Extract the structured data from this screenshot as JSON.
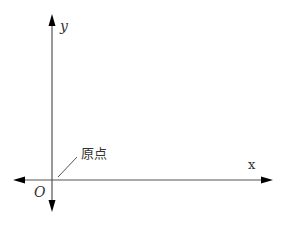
{
  "diagram": {
    "type": "coordinate-axes",
    "x_axis": {
      "label": "x",
      "direction": "bidirectional"
    },
    "y_axis": {
      "label": "y",
      "direction": "bidirectional"
    },
    "origin": {
      "label": "O",
      "annotation": "原点"
    },
    "colors": {
      "axis": "#333333",
      "arrowhead": "#000000",
      "text": "#333333",
      "background": "#ffffff"
    }
  }
}
